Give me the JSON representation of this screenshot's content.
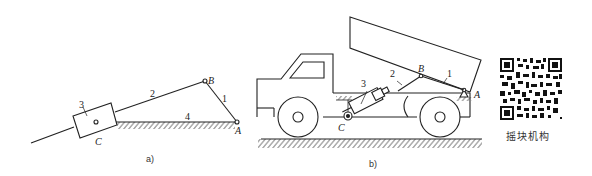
{
  "figure_a": {
    "caption": "a)",
    "labels": {
      "joint_A": "A",
      "joint_B": "B",
      "joint_C": "C",
      "link_1": "1",
      "link_2": "2",
      "link_3": "3",
      "link_4": "4"
    }
  },
  "figure_b": {
    "caption": "b)",
    "labels": {
      "joint_A": "A",
      "joint_B": "B",
      "joint_C": "C",
      "link_1": "1",
      "link_2": "2",
      "link_3": "3"
    }
  },
  "qr": {
    "caption": "摇块机构"
  },
  "colors": {
    "line": "#222222",
    "background": "#ffffff"
  }
}
